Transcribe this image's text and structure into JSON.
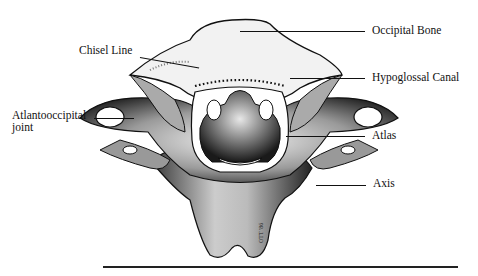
{
  "figure": {
    "labels": [
      {
        "id": "occipital-bone",
        "text": "Occipital Bone"
      },
      {
        "id": "chisel-line",
        "text": "Chisel Line"
      },
      {
        "id": "hypoglossal-canal",
        "text": "Hypoglossal Canal"
      },
      {
        "id": "atlantooccipital-joint",
        "line1": "Atlantooccipital",
        "line2": "joint"
      },
      {
        "id": "atlas",
        "text": "Atlas"
      },
      {
        "id": "axis",
        "text": "Axis"
      }
    ],
    "signature": "OTT '86",
    "colors": {
      "ink": "#111111",
      "background": "#ffffff",
      "shade": "#555555"
    }
  }
}
